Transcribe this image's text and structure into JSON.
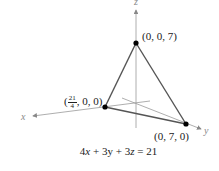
{
  "figure": {
    "axes": {
      "x_label": "x",
      "y_label": "y",
      "z_label": "z"
    },
    "points": [
      {
        "id": "z_intercept",
        "label": "(0, 0, 7)",
        "coords": [
          0,
          0,
          7
        ]
      },
      {
        "id": "x_intercept",
        "label_prefix": "(",
        "label_frac_num": "21",
        "label_frac_den": "4",
        "label_suffix": ", 0, 0)",
        "coords": [
          5.25,
          0,
          0
        ]
      },
      {
        "id": "y_intercept",
        "label": "(0, 7, 0)",
        "coords": [
          0,
          7,
          0
        ]
      }
    ],
    "equation": {
      "text": "4x + 3y + 3z = 21",
      "parts": [
        "4",
        "x",
        " + 3y + 3",
        "z",
        " = 21"
      ]
    },
    "colors": {
      "triangle_edge": "#555555",
      "axis": "#999999",
      "point": "#000000"
    }
  }
}
